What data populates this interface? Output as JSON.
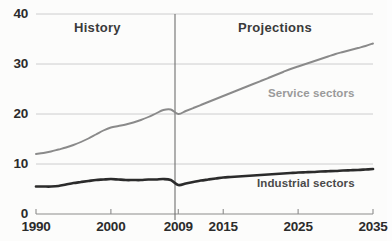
{
  "chart_data": {
    "type": "line",
    "title": "",
    "subtitle": "",
    "xlabel": "",
    "ylabel": "",
    "xlim": [
      1990,
      2035
    ],
    "ylim": [
      0,
      40
    ],
    "grid": true,
    "legend_position": "inline-annotations",
    "x_tick_labels": [
      "1990",
      "2000",
      "2009",
      "2015",
      "2025",
      "2035"
    ],
    "x_tick_values": [
      1990,
      2000,
      2009,
      2015,
      2025,
      2035
    ],
    "y_tick_labels": [
      "0",
      "10",
      "20",
      "30",
      "40"
    ],
    "y_tick_values": [
      0,
      10,
      20,
      30,
      40
    ],
    "annotations": [
      {
        "text": "History",
        "x": 1999,
        "y": 38
      },
      {
        "text": "Projections",
        "x": 2022,
        "y": 38
      }
    ],
    "reference_line": {
      "x": 2009,
      "label": "2009"
    },
    "series": [
      {
        "name": "Service sectors",
        "color": "#8a8a8a",
        "label_x": 2024,
        "label_y": 24.5,
        "x": [
          1990,
          1991,
          1992,
          1993,
          1994,
          1995,
          1996,
          1997,
          1998,
          1999,
          2000,
          2001,
          2002,
          2003,
          2004,
          2005,
          2006,
          2007,
          2008,
          2009,
          2010,
          2011,
          2012,
          2013,
          2014,
          2015,
          2016,
          2017,
          2018,
          2019,
          2020,
          2021,
          2022,
          2023,
          2024,
          2025,
          2026,
          2027,
          2028,
          2029,
          2030,
          2031,
          2032,
          2033,
          2034,
          2035
        ],
        "values": [
          12.0,
          12.2,
          12.5,
          12.9,
          13.3,
          13.8,
          14.4,
          15.1,
          15.9,
          16.7,
          17.3,
          17.6,
          17.9,
          18.3,
          18.8,
          19.4,
          20.1,
          20.8,
          20.9,
          20.0,
          20.6,
          21.2,
          21.8,
          22.4,
          23.0,
          23.6,
          24.2,
          24.8,
          25.4,
          26.0,
          26.6,
          27.2,
          27.8,
          28.4,
          29.0,
          29.5,
          30.0,
          30.5,
          31.0,
          31.5,
          32.0,
          32.4,
          32.8,
          33.2,
          33.6,
          34.1
        ]
      },
      {
        "name": "Industrial sectors",
        "color": "#2b2b2b",
        "label_x": 2026,
        "label_y": 3.6,
        "x": [
          1990,
          1991,
          1992,
          1993,
          1994,
          1995,
          1996,
          1997,
          1998,
          1999,
          2000,
          2001,
          2002,
          2003,
          2004,
          2005,
          2006,
          2007,
          2008,
          2009,
          2010,
          2011,
          2012,
          2013,
          2014,
          2015,
          2016,
          2017,
          2018,
          2019,
          2020,
          2021,
          2022,
          2023,
          2024,
          2025,
          2026,
          2027,
          2028,
          2029,
          2030,
          2031,
          2032,
          2033,
          2034,
          2035
        ],
        "values": [
          5.5,
          5.5,
          5.5,
          5.6,
          5.9,
          6.2,
          6.4,
          6.6,
          6.8,
          6.9,
          7.0,
          6.9,
          6.8,
          6.8,
          6.8,
          6.9,
          6.9,
          7.0,
          6.8,
          5.8,
          6.1,
          6.4,
          6.7,
          6.9,
          7.1,
          7.3,
          7.4,
          7.5,
          7.6,
          7.7,
          7.8,
          7.9,
          8.0,
          8.1,
          8.2,
          8.3,
          8.35,
          8.4,
          8.5,
          8.55,
          8.6,
          8.7,
          8.75,
          8.8,
          8.9,
          9.0
        ]
      }
    ]
  },
  "axis": {
    "y_ticks": [
      {
        "label": "40",
        "value": 40
      },
      {
        "label": "30",
        "value": 30
      },
      {
        "label": "20",
        "value": 20
      },
      {
        "label": "10",
        "value": 10
      },
      {
        "label": "0",
        "value": 0
      }
    ],
    "x_ticks": [
      {
        "label": "1990",
        "value": 1990
      },
      {
        "label": "2000",
        "value": 2000
      },
      {
        "label": "2009",
        "value": 2009
      },
      {
        "label": "2015",
        "value": 2015
      },
      {
        "label": "2025",
        "value": 2025
      },
      {
        "label": "2035",
        "value": 2035
      }
    ]
  },
  "labels": {
    "history": "History",
    "projections": "Projections",
    "service_sectors": "Service sectors",
    "industrial_sectors": "Industrial sectors"
  },
  "colors": {
    "service": "#8a8a8a",
    "industrial": "#2b2b2b",
    "grid": "#c8c8c8",
    "axis": "#8c8c8c",
    "divider": "#6e6e6e",
    "background": "#fcfcfb",
    "tick_text": "#2b2b2b"
  }
}
